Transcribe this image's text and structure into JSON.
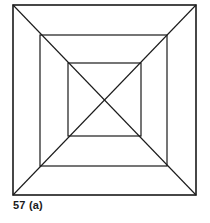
{
  "figure": {
    "caption": "57 (a)",
    "stroke_color": "#1a1a1a",
    "squares": [
      {
        "name": "outer",
        "x1": 13,
        "y1": 5,
        "x2": 196,
        "y2": 195,
        "stroke_width": 1.6
      },
      {
        "name": "middle",
        "x1": 40,
        "y1": 35,
        "x2": 167,
        "y2": 166,
        "stroke_width": 1.2
      },
      {
        "name": "inner",
        "x1": 68,
        "y1": 63,
        "x2": 141,
        "y2": 136,
        "stroke_width": 1.2
      }
    ],
    "diagonals": [
      {
        "from": [
          13,
          5
        ],
        "to": [
          196,
          195
        ]
      },
      {
        "from": [
          196,
          5
        ],
        "to": [
          13,
          195
        ]
      }
    ]
  }
}
